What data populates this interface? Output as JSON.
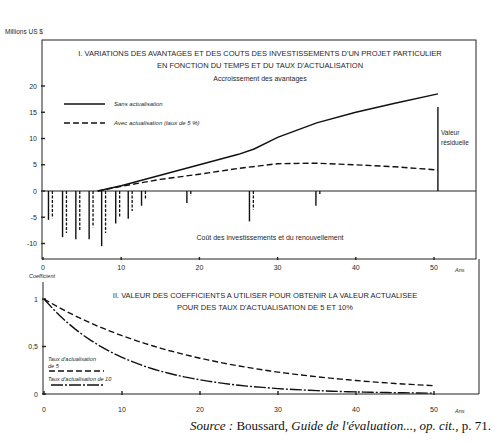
{
  "chart_data": [
    {
      "type": "line",
      "title": "I. VARIATIONS DES AVANTAGES ET DES COUTS DES INVESTISSEMENTS D'UN PROJET PARTICULIER EN FONCTION DU TEMPS ET DU TAUX D'ACTUALISATION",
      "title_line1": "I.  VARIATIONS DES AVANTAGES ET DES COUTS DES INVESTISSEMENTS D'UN PROJET PARTICULIER",
      "title_line2": "EN FONCTION DU TEMPS ET DU TAUX D'ACTUALISATION",
      "subtitle": "Accroissement des avantages",
      "lower_annotation": "Coût des investissements et du renouvellement",
      "residual_label_1": "Valeur",
      "residual_label_2": "résiduelle",
      "ylabel": "Millions US $",
      "xlabel": "Ans",
      "ylim": [
        -12.5,
        22
      ],
      "xlim": [
        0,
        55
      ],
      "y_ticks": [
        20,
        15,
        10,
        5,
        0,
        -5,
        -10
      ],
      "y_tick_labels": [
        "20",
        "15",
        "10",
        "5",
        "0",
        "-5",
        "-10"
      ],
      "x_ticks": [
        0,
        10,
        20,
        30,
        40,
        50
      ],
      "x_tick_labels": [
        "0",
        "10",
        "20",
        "30",
        "40",
        "50"
      ],
      "legend": [
        {
          "name": "Sans actualisation",
          "style": "solid"
        },
        {
          "name": "Avec actualisation (taux de 5 %)",
          "style": "dashed"
        }
      ],
      "series": [
        {
          "name": "Sans actualisation",
          "style": "solid",
          "x": [
            7,
            10,
            15,
            20,
            25,
            27,
            30,
            35,
            40,
            45,
            50.5
          ],
          "y": [
            0,
            1,
            3,
            5,
            7,
            8,
            10.2,
            13,
            15,
            16.7,
            18.5
          ]
        },
        {
          "name": "Avec actualisation (taux de 5 %)",
          "style": "dashed",
          "x": [
            7,
            10,
            15,
            20,
            25,
            30,
            35,
            40,
            45,
            50.5
          ],
          "y": [
            0,
            0.9,
            2.2,
            3.2,
            4.3,
            5.2,
            5.3,
            5,
            4.6,
            4
          ]
        }
      ],
      "cost_bars_undiscounted": {
        "x": [
          0.7,
          2.5,
          4.2,
          5.9,
          7.5,
          9.3,
          10.9,
          12.6,
          18.4,
          26.4,
          34.9
        ],
        "y": [
          -5.5,
          -8.8,
          -9.2,
          -9.2,
          -10.5,
          -6.2,
          -5.3,
          -2.8,
          -2.3,
          -5.8,
          -2.8
        ]
      },
      "cost_bars_discounted": {
        "x": [
          1.2,
          3.0,
          4.7,
          6.4,
          8.0,
          9.8,
          11.4,
          13.1,
          18.9,
          26.9,
          35.4
        ],
        "y": [
          -5.2,
          -8.0,
          -7.5,
          -6.9,
          -8.0,
          -5.0,
          -3.8,
          -1.5,
          -0.9,
          -3.5,
          -0.7
        ]
      },
      "residual_value_bar": {
        "x": 50.5,
        "y_top": 16,
        "y_bottom": 0
      }
    },
    {
      "type": "line",
      "title": "II. VALEUR DES COEFFICIENTS A UTILISER POUR OBTENIR LA VALEUR ACTUALISEE POUR DES TAUX D'ACTUALISATION DE 5 ET 10%",
      "title_line1": "II.  VALEUR DES COEFFICIENTS A UTILISER POUR OBTENIR LA VALEUR ACTUALISEE",
      "title_line2": "POUR DES TAUX D'ACTUALISATION DE 5 ET 10%",
      "ylabel": "Coefficient",
      "xlabel": "Ans",
      "ylim": [
        0,
        1.05
      ],
      "xlim": [
        0,
        55
      ],
      "y_ticks": [
        1,
        0.5,
        0
      ],
      "y_tick_labels": [
        "1",
        "0,5",
        "0"
      ],
      "x_ticks": [
        0,
        10,
        20,
        30,
        40,
        50
      ],
      "x_tick_labels": [
        "0",
        "10",
        "20",
        "30",
        "40",
        "50"
      ],
      "legend": [
        {
          "name": "Taux d'actualisation de 5",
          "line1": "Taux d'actualisation",
          "line2": "de 5",
          "style": "dashed"
        },
        {
          "name": "Taux d'actualisation de 10",
          "line1": "Taux d'actualisation de 10",
          "style": "dashdot"
        }
      ],
      "series": [
        {
          "name": "Taux d'actualisation de 5",
          "style": "dashed",
          "x": [
            0,
            5,
            10,
            15,
            20,
            25,
            30,
            35,
            40,
            45,
            50
          ],
          "y": [
            1,
            0.784,
            0.614,
            0.481,
            0.377,
            0.295,
            0.231,
            0.181,
            0.142,
            0.111,
            0.087
          ]
        },
        {
          "name": "Taux d'actualisation de 10",
          "style": "dashdot",
          "x": [
            0,
            5,
            10,
            15,
            20,
            25,
            30,
            35,
            40,
            45,
            50
          ],
          "y": [
            1,
            0.621,
            0.386,
            0.239,
            0.149,
            0.092,
            0.057,
            0.036,
            0.022,
            0.014,
            0.009
          ]
        }
      ]
    }
  ],
  "source": {
    "prefix": "Source :",
    "author": "Boussard,",
    "title": "Guide de l'évaluation...,",
    "ref": "op. cit.,",
    "page": "p. 71."
  }
}
